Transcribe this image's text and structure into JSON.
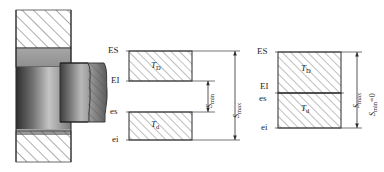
{
  "figure": {
    "type": "engineering-tolerance-fit-diagram",
    "background": "#ffffff",
    "line_color": "#262626",
    "hatch_color": "#4a4a4a",
    "panels": [
      {
        "id": "section-view",
        "name": "shaft-in-hole-section",
        "description": "Cross-section of shaft assembled in housing bore with broken-out section"
      },
      {
        "id": "clearance-fit",
        "name": "clearance-fit-tolerance-zones",
        "description": "Hole tolerance zone above shaft tolerance zone, separated"
      },
      {
        "id": "zero-clearance-fit",
        "name": "zero-minimum-clearance-tolerance-zones",
        "description": "Hole tolerance zone directly above shaft tolerance zone, touching"
      }
    ]
  },
  "middle_diagram": {
    "deviation_labels": {
      "hole_upper": "ES",
      "hole_lower": "EI",
      "shaft_upper": "es",
      "shaft_lower": "ei"
    },
    "zone_labels": {
      "hole": "T",
      "hole_sub": "D",
      "shaft": "T",
      "shaft_sub": "d"
    },
    "dimensions": {
      "min_clearance": "S",
      "min_clearance_sub": "min",
      "max_clearance": "S",
      "max_clearance_sub": "max"
    }
  },
  "right_diagram": {
    "deviation_labels": {
      "hole_upper": "ES",
      "hole_lower": "EI",
      "shaft_upper": "es",
      "shaft_lower": "ei"
    },
    "zone_labels": {
      "hole": "T",
      "hole_sub": "D",
      "shaft": "T",
      "shaft_sub": "d"
    },
    "dimensions": {
      "max_clearance": "S",
      "max_clearance_sub": "max",
      "min_clearance": "S",
      "min_clearance_sub": "min",
      "min_clearance_value": "=0"
    }
  }
}
